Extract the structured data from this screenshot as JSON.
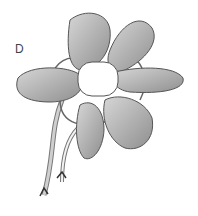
{
  "figure": {
    "label": "D",
    "colors": {
      "petal_fill": "#bdbdbd",
      "petal_shadow": "#8f8f8f",
      "center_fill": "#ffffff",
      "outline": "#555555",
      "wire": "#e0e0e0"
    }
  }
}
